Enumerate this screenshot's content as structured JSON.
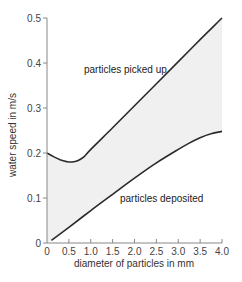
{
  "chart_data": {
    "type": "line",
    "title": "",
    "xlabel": "diameter of particles in mm",
    "ylabel": "water speed in m/s",
    "xlim": [
      0,
      4.0
    ],
    "ylim": [
      0,
      0.5
    ],
    "x_ticks": [
      "0",
      "0.5",
      "1.0",
      "1.5",
      "2.0",
      "2.5",
      "3.0",
      "3.5",
      "4.0"
    ],
    "y_ticks": [
      "0",
      "0.1",
      "0.2",
      "0.3",
      "0.4",
      "0.5"
    ],
    "grid": false,
    "legend": "none (curves labelled inline)",
    "shaded_region": "between the two curves, light gray",
    "series": [
      {
        "name": "particles picked up",
        "x": [
          0.0,
          0.15,
          0.3,
          0.45,
          0.57,
          0.7,
          0.85,
          1.0,
          1.5,
          2.0,
          2.5,
          3.0,
          3.5,
          4.0
        ],
        "y": [
          0.2,
          0.192,
          0.185,
          0.181,
          0.18,
          0.183,
          0.192,
          0.208,
          0.256,
          0.305,
          0.354,
          0.403,
          0.452,
          0.5
        ]
      },
      {
        "name": "particles deposited",
        "x": [
          0.1,
          0.5,
          1.0,
          1.5,
          2.0,
          2.5,
          3.0,
          3.25,
          3.5,
          3.75,
          4.0
        ],
        "y": [
          0.006,
          0.035,
          0.072,
          0.108,
          0.144,
          0.178,
          0.208,
          0.222,
          0.234,
          0.243,
          0.248
        ]
      }
    ],
    "annotations": [
      {
        "text": "particles picked up",
        "x": 0.85,
        "y": 0.38
      },
      {
        "text": "particles deposited",
        "x": 1.65,
        "y": 0.09
      }
    ]
  },
  "labels": {
    "xlabel": "diameter of particles in mm",
    "ylabel": "water speed in m/s",
    "annot_upper": "particles picked up",
    "annot_lower": "particles deposited",
    "x_ticks": [
      "0",
      "0.5",
      "1.0",
      "1.5",
      "2.0",
      "2.5",
      "3.0",
      "3.5",
      "4.0"
    ],
    "y_ticks": [
      "0",
      "0.1",
      "0.2",
      "0.3",
      "0.4",
      "0.5"
    ]
  }
}
